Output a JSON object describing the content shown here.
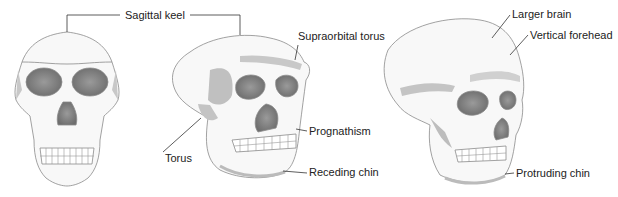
{
  "diagram": {
    "skulls": [
      {
        "id": "skull-front",
        "view": "frontal"
      },
      {
        "id": "skull-archaic",
        "view": "three-quarter"
      },
      {
        "id": "skull-modern",
        "view": "three-quarter"
      }
    ],
    "labels": {
      "sagittal_keel": "Sagittal keel",
      "supraorbital_torus": "Supraorbital torus",
      "torus": "Torus",
      "prognathism": "Prognathism",
      "receding_chin": "Receding chin",
      "larger_brain": "Larger brain",
      "vertical_forehead": "Vertical forehead",
      "protruding_chin": "Protruding chin"
    },
    "colors": {
      "bone": "#f7f7f7",
      "outline": "#8a8a8a",
      "shadow": "#b9b9b9",
      "cavity": "#7a7a7a",
      "leader": "#333333",
      "text": "#222222"
    }
  }
}
